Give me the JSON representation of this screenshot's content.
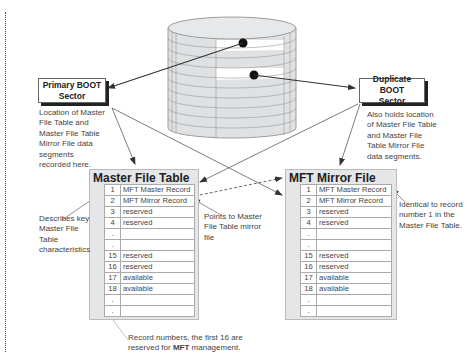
{
  "diagram": {
    "boot_sectors": {
      "primary": {
        "label_line1": "Primary BOOT",
        "label_line2": "Sector",
        "note": [
          "Location of Master",
          "File Table and",
          "Master File Table",
          "Mirror File data",
          "segments",
          "recorded here."
        ]
      },
      "duplicate": {
        "label_line1": "Duplicate BOOT",
        "label_line2": "Sector",
        "note": [
          "Also holds location",
          "of Master File Table",
          "and Master File",
          "Table Mirror File",
          "data segments."
        ]
      }
    },
    "master_file_table": {
      "title": "Master File Table",
      "rows": [
        {
          "num": "1",
          "value": "MFT Master Record"
        },
        {
          "num": "2",
          "value": "MFT Mirror Record"
        },
        {
          "num": "3",
          "value": "reserved"
        },
        {
          "num": "4",
          "value": "reserved"
        },
        {
          "num": ".",
          "value": ""
        },
        {
          "num": ".",
          "value": ""
        },
        {
          "num": "15",
          "value": "reserved"
        },
        {
          "num": "16",
          "value": "reserved"
        },
        {
          "num": "17",
          "value": "available"
        },
        {
          "num": "18",
          "value": "available"
        },
        {
          "num": ".",
          "value": ""
        },
        {
          "num": ".",
          "value": ""
        }
      ]
    },
    "mft_mirror_file": {
      "title": "MFT Mirror File",
      "rows": [
        {
          "num": "1",
          "value": "MFT Master Record"
        },
        {
          "num": "2",
          "value": "MFT Mirror Record"
        },
        {
          "num": "3",
          "value": "reserved"
        },
        {
          "num": "4",
          "value": "reserved"
        },
        {
          "num": ".",
          "value": ""
        },
        {
          "num": ".",
          "value": ""
        },
        {
          "num": "15",
          "value": "reserved"
        },
        {
          "num": "16",
          "value": "reserved"
        },
        {
          "num": "17",
          "value": "available"
        },
        {
          "num": "18",
          "value": "available"
        },
        {
          "num": ".",
          "value": ""
        },
        {
          "num": ".",
          "value": ""
        }
      ]
    },
    "annotations": {
      "describes_key": [
        "Describes key",
        "Master File",
        "Table",
        "characteristics"
      ],
      "points_to_mirror": [
        "Points to Master",
        "File Table mirror",
        "file"
      ],
      "identical_to_record": [
        "Identical to record",
        "number 1 in the",
        "Master File Table."
      ],
      "record_numbers_line1": "Record numbers, the first 16 are",
      "record_numbers_line2_prefix": "reserved for ",
      "record_numbers_line2_bold": "MFT",
      "record_numbers_line2_suffix": " management."
    }
  }
}
